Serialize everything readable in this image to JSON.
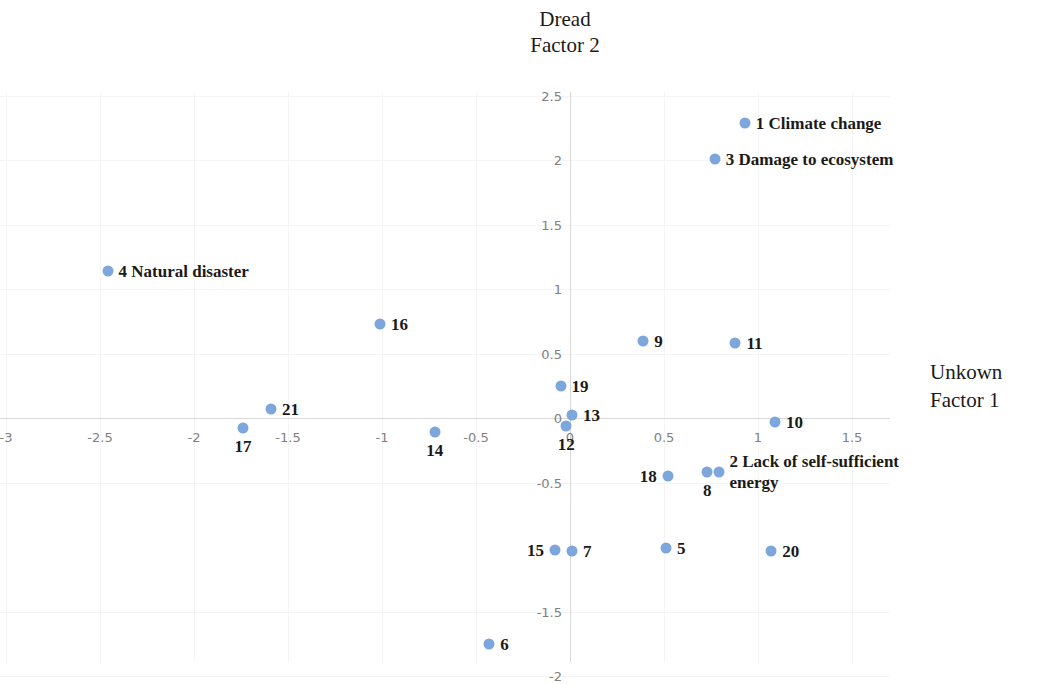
{
  "chart_data": {
    "type": "scatter",
    "title": "Dread\nFactor 2",
    "ylabel": "Dread\nFactor 2",
    "xlabel": "Unkown\nFactor 1",
    "xlim": [
      -3.2,
      1.7
    ],
    "ylim": [
      -2.05,
      2.6
    ],
    "xticks": [
      "-3",
      "-2.5",
      "-2",
      "-1.5",
      "-1",
      "-0.5",
      "0",
      "0.5",
      "1",
      "1.5"
    ],
    "xtick_values": [
      -3,
      -2.5,
      -2,
      -1.5,
      -1,
      -0.5,
      0,
      0.5,
      1,
      1.5
    ],
    "yticks": [
      "2.5",
      "2",
      "1.5",
      "1",
      "0.5",
      "0",
      "-0.5",
      "-1.5",
      "-2"
    ],
    "ytick_values": [
      2.5,
      2,
      1.5,
      1,
      0.5,
      0,
      -0.5,
      -1.5,
      -2
    ],
    "grid": true,
    "legend": "none",
    "point_color": "#7da7dc",
    "points": [
      {
        "id": "1",
        "label": "1 Climate change",
        "x": 0.93,
        "y": 2.29,
        "side": "right"
      },
      {
        "id": "3",
        "label": "3 Damage to ecosystem",
        "x": 0.77,
        "y": 2.01,
        "side": "right"
      },
      {
        "id": "4",
        "label": "4 Natural disaster",
        "x": -2.46,
        "y": 1.14,
        "side": "right"
      },
      {
        "id": "16",
        "label": "16",
        "x": -1.01,
        "y": 0.73,
        "side": "right"
      },
      {
        "id": "9",
        "label": "9",
        "x": 0.39,
        "y": 0.6,
        "side": "right"
      },
      {
        "id": "11",
        "label": "11",
        "x": 0.88,
        "y": 0.58,
        "side": "right"
      },
      {
        "id": "19",
        "label": "19",
        "x": -0.05,
        "y": 0.25,
        "side": "right"
      },
      {
        "id": "21",
        "label": "21",
        "x": -1.59,
        "y": 0.07,
        "side": "right"
      },
      {
        "id": "13",
        "label": "13",
        "x": 0.01,
        "y": 0.02,
        "side": "right"
      },
      {
        "id": "10",
        "label": "10",
        "x": 1.09,
        "y": -0.03,
        "side": "right"
      },
      {
        "id": "12",
        "label": "12",
        "x": -0.02,
        "y": -0.06,
        "side": "below"
      },
      {
        "id": "17",
        "label": "17",
        "x": -1.74,
        "y": -0.08,
        "side": "below"
      },
      {
        "id": "14",
        "label": "14",
        "x": -0.72,
        "y": -0.11,
        "side": "below"
      },
      {
        "id": "18",
        "label": "18",
        "x": 0.52,
        "y": -0.45,
        "side": "left"
      },
      {
        "id": "8",
        "label": "8",
        "x": 0.73,
        "y": -0.42,
        "side": "below"
      },
      {
        "id": "2",
        "label": "2 Lack of self-sufficient\nenergy",
        "x": 0.79,
        "y": -0.42,
        "side": "right"
      },
      {
        "id": "15",
        "label": "15",
        "x": -0.08,
        "y": -1.02,
        "side": "left"
      },
      {
        "id": "7",
        "label": "7",
        "x": 0.01,
        "y": -1.03,
        "side": "right"
      },
      {
        "id": "5",
        "label": "5",
        "x": 0.51,
        "y": -1.01,
        "side": "right"
      },
      {
        "id": "20",
        "label": "20",
        "x": 1.07,
        "y": -1.03,
        "side": "right"
      },
      {
        "id": "6",
        "label": "6",
        "x": -0.43,
        "y": -1.75,
        "side": "right"
      }
    ]
  }
}
